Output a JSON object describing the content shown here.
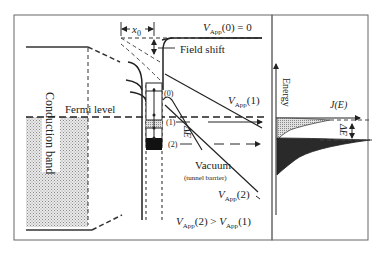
{
  "diagram": {
    "labels": {
      "vapp0": "V",
      "vapp0_sub": "App",
      "vapp0_rest": "(0) = 0",
      "x0": "x",
      "x0_sub": "0",
      "field_shift": "Field shift",
      "vapp1": "V",
      "vapp1_sub": "App",
      "vapp1_rest": "(1)",
      "vapp2": "V",
      "vapp2_sub": "App",
      "vapp2_rest": "(2)",
      "fermi_level": "Fermi level",
      "conduction_band": "Conduction band",
      "level0": "(0)",
      "level1": "(1)",
      "level2": "(2)",
      "delta_e": "ΔE",
      "vacuum": "Vacuum",
      "tunnel_barrier": "(tunnel barrier)",
      "comparison_v2": "V",
      "comparison_v2_sub": "App",
      "comparison_v2_rest": "(2) > ",
      "comparison_v1": "V",
      "comparison_v1_sub": "App",
      "comparison_v1_rest": "(1)",
      "energy_axis": "Energy",
      "je_axis": "J(E)",
      "delta_e_right": "ΔE"
    },
    "colors": {
      "line": "#222222",
      "frame": "#555555",
      "stipple_light": "#cfcfcf",
      "dark_fill": "#2a2a2a"
    }
  }
}
